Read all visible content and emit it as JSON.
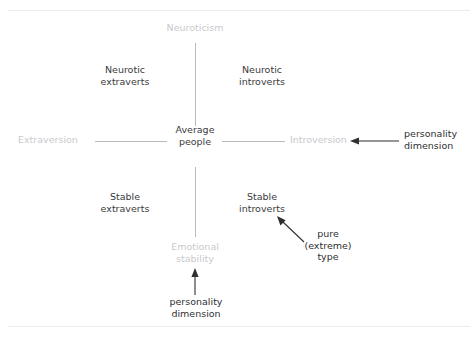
{
  "figure": {
    "width": 476,
    "height": 342,
    "background": "#ffffff",
    "cropped_caption_fragment": ""
  },
  "colors": {
    "pole_label": "#c9c9cd",
    "quadrant_label": "#3b3b3d",
    "annotation_label": "#2f2f31",
    "axis_line": "#b9b9bd",
    "divider": "#ececee"
  },
  "diagram": {
    "type": "two-axis-quadrant",
    "poles": {
      "top": "Neuroticism",
      "bottom": "Emotional\nstability",
      "left": "Extraversion",
      "right": "Introversion"
    },
    "center": "Average\npeople",
    "quadrants": {
      "top_left": "Neurotic\nextraverts",
      "top_right": "Neurotic\nintroverts",
      "bottom_left": "Stable\nextraverts",
      "bottom_right": "Stable\nintroverts"
    },
    "annotations": {
      "horizontal_axis_callout": "personality\ndimension",
      "vertical_axis_callout": "personality\ndimension",
      "extreme_type_callout": "pure\n(extreme)\ntype"
    },
    "arrows": [
      {
        "name": "arrow-to-introversion",
        "direction": "left",
        "target": "Introversion"
      },
      {
        "name": "arrow-to-emotional-stability",
        "direction": "up",
        "target": "Emotional stability"
      },
      {
        "name": "arrow-to-stable-introverts",
        "direction": "up-left",
        "target": "Stable introverts"
      }
    ]
  }
}
